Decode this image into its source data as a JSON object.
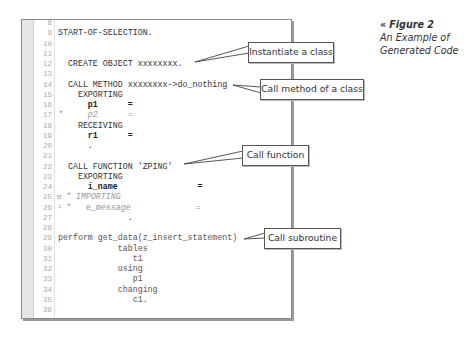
{
  "caption": {
    "arrow": "«",
    "figure_label": "Figure 2",
    "title_line1": "An Example of",
    "title_line2": "Generated Code"
  },
  "editor": {
    "lines": [
      {
        "n": "8",
        "code": "",
        "style": ""
      },
      {
        "n": "9",
        "code": "START-OF-SELECTION.",
        "style": ""
      },
      {
        "n": "10",
        "code": "",
        "style": ""
      },
      {
        "n": "11",
        "code": "",
        "style": ""
      },
      {
        "n": "12",
        "code": "  CREATE OBJECT xxxxxxxx.",
        "style": ""
      },
      {
        "n": "13",
        "code": "",
        "style": ""
      },
      {
        "n": "14",
        "code": "  CALL METHOD xxxxxxxx->do_nothing",
        "style": ""
      },
      {
        "n": "15",
        "code": "    EXPORTING",
        "style": ""
      },
      {
        "n": "16",
        "code": "      p1      =",
        "style": "bold"
      },
      {
        "n": "17",
        "code": "*     p2      =",
        "style": "comment"
      },
      {
        "n": "18",
        "code": "    RECEIVING",
        "style": ""
      },
      {
        "n": "19",
        "code": "      r1      =",
        "style": "bold"
      },
      {
        "n": "20",
        "code": "      .",
        "style": ""
      },
      {
        "n": "21",
        "code": "",
        "style": ""
      },
      {
        "n": "22",
        "code": "  CALL FUNCTION 'ZPING'",
        "style": ""
      },
      {
        "n": "23",
        "code": "    EXPORTING",
        "style": ""
      },
      {
        "n": "24",
        "code": "      i_name                =",
        "style": "bold"
      },
      {
        "n": "25",
        "code": "* IMPORTING",
        "style": "comment",
        "marker": "⊟"
      },
      {
        "n": "26",
        "code": "*   e_message             =",
        "style": "comment",
        "marker": "└"
      },
      {
        "n": "27",
        "code": "              .",
        "style": ""
      },
      {
        "n": "28",
        "code": "",
        "style": ""
      },
      {
        "n": "29",
        "code": "perform get_data(z_insert_statement)",
        "style": "light"
      },
      {
        "n": "30",
        "code": "            tables",
        "style": "light"
      },
      {
        "n": "31",
        "code": "               t1",
        "style": "light"
      },
      {
        "n": "32",
        "code": "            using",
        "style": "light"
      },
      {
        "n": "33",
        "code": "               p1",
        "style": "light"
      },
      {
        "n": "34",
        "code": "            changing",
        "style": "light"
      },
      {
        "n": "35",
        "code": "               c1.",
        "style": "light"
      },
      {
        "n": "36",
        "code": "",
        "style": ""
      }
    ]
  },
  "callouts": [
    {
      "label": "Instantiate a class"
    },
    {
      "label": "Call method of a class"
    },
    {
      "label": "Call function"
    },
    {
      "label": "Call subroutine"
    }
  ]
}
